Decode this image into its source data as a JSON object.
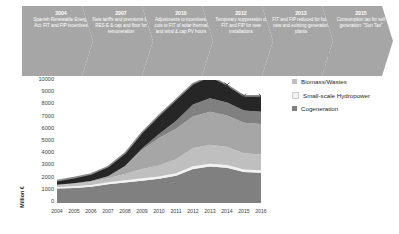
{
  "timeline": {
    "steps": [
      {
        "year": "2004",
        "text": "Spanish Renewable Energy Act: FIT and FIP incentives"
      },
      {
        "year": "2007",
        "text": "New tariffs and premiums for RES-E & cap and floor for remuneration"
      },
      {
        "year": "2010",
        "text": "Adjustments to incentives, cuts to FIT of solar thermal and wind & cap PV hours"
      },
      {
        "year": "2012",
        "text": "Temporary suppression of FIT and FIP for new installations"
      },
      {
        "year": "2013",
        "text": "FIT and FIP reduced for both new and existing generation plants"
      },
      {
        "year": "2015",
        "text": "Consumption tax for self generation: \"Sun Tax\""
      }
    ],
    "arrow_color": "#a6a6a6",
    "text_color": "#ffffff"
  },
  "chart_data": {
    "type": "area",
    "title": "",
    "xlabel": "",
    "ylabel": "Million €",
    "ylim": [
      0,
      10000
    ],
    "ytick_labels": [
      "10000",
      "9000",
      "8000",
      "7000",
      "6000",
      "5000",
      "4000",
      "3000",
      "2000",
      "1000",
      "0"
    ],
    "grid": false,
    "legend_position": "right",
    "categories": [
      "2004",
      "2005",
      "2006",
      "2007",
      "2008",
      "2009",
      "2010",
      "2011",
      "2012",
      "2013",
      "2014",
      "2015",
      "2016"
    ],
    "stacked": true,
    "stack_order_bottom_to_top": [
      "Cogeneration",
      "Small-scale Hydropower",
      "Biomass/Wastes",
      "Solar PV",
      "Solar Thermal",
      "Wind"
    ],
    "series": [
      {
        "name": "Cogeneration",
        "color": "#808080",
        "values": [
          1100,
          1150,
          1250,
          1450,
          1600,
          1750,
          1900,
          2150,
          2700,
          2900,
          2800,
          2450,
          2400
        ]
      },
      {
        "name": "Small-scale Hydropower",
        "color": "#f2f2f2",
        "values": [
          130,
          140,
          150,
          170,
          180,
          190,
          200,
          210,
          230,
          240,
          230,
          210,
          205
        ]
      },
      {
        "name": "Biomass/Wastes",
        "color": "#bfbfbf",
        "values": [
          170,
          210,
          250,
          330,
          520,
          760,
          900,
          1140,
          1470,
          1560,
          1470,
          1340,
          1295
        ]
      },
      {
        "name": "Solar PV",
        "color": "#a6a6a6",
        "values": [
          20,
          40,
          70,
          160,
          620,
          1560,
          2250,
          2500,
          2600,
          2700,
          2600,
          2500,
          2500
        ]
      },
      {
        "name": "Solar Thermal",
        "color": "#808080",
        "values": [
          0,
          0,
          0,
          10,
          40,
          120,
          320,
          640,
          1000,
          1100,
          1050,
          1000,
          1000
        ]
      },
      {
        "name": "Wind",
        "color": "#262626",
        "values": [
          330,
          460,
          580,
          780,
          1040,
          1320,
          1530,
          1760,
          1700,
          1800,
          1450,
          1200,
          1300
        ]
      }
    ],
    "total_line": {
      "name": "Total",
      "color": "#8c8c8c",
      "marker": "x",
      "values": [
        1750,
        2000,
        2300,
        2900,
        4000,
        5700,
        7100,
        8400,
        9700,
        10300,
        9600,
        8700,
        8700
      ]
    }
  },
  "legend": {
    "items": [
      {
        "label": "Wind",
        "color": "#262626"
      },
      {
        "label": "Solar Thermal",
        "color": "#808080"
      },
      {
        "label": "Solar PV",
        "color": "#a6a6a6"
      },
      {
        "label": "Biomass/Wastes",
        "color": "#bfbfbf"
      },
      {
        "label": "Small-scale Hydropower",
        "color": "#f2f2f2"
      },
      {
        "label": "Cogeneration",
        "color": "#808080"
      }
    ]
  }
}
